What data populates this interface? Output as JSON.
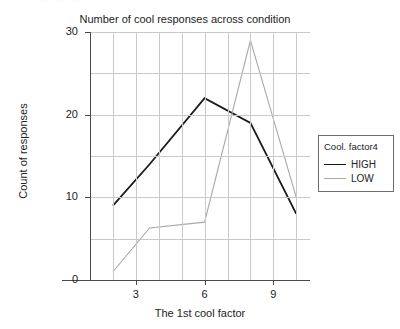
{
  "clipped_header": {
    "text": "• • •   ▪  •▪ ▪   ▪▪  ▪ ▪▪▪ ▪▪"
  },
  "chart_data": {
    "type": "line",
    "title": "Number of cool responses across condition",
    "xlabel": "The 1st cool factor",
    "ylabel": "Count of responses",
    "xlim": [
      1,
      10.6
    ],
    "ylim": [
      0,
      30
    ],
    "grid": true,
    "legend_position": "right",
    "legend_title": "Cool. factor4",
    "x": [
      2,
      3.6,
      6,
      8,
      10
    ],
    "xticks": [
      3,
      6,
      9
    ],
    "xtick_labels": [
      "3",
      "6",
      "9"
    ],
    "yticks": [
      0,
      10,
      20,
      30
    ],
    "ytick_labels": [
      "0",
      "10",
      "20",
      "30"
    ],
    "gridlines_y": [
      0,
      5,
      10,
      15,
      20,
      25,
      30
    ],
    "gridlines_x": [
      2,
      3,
      4,
      5,
      6,
      7,
      8,
      9,
      10
    ],
    "series": [
      {
        "name": "HIGH",
        "color": "#1a1a1a",
        "values": [
          9,
          14,
          22,
          19,
          8
        ]
      },
      {
        "name": "LOW",
        "color": "#a8a8a8",
        "values": [
          1,
          6.3,
          7,
          29,
          10
        ]
      }
    ]
  }
}
